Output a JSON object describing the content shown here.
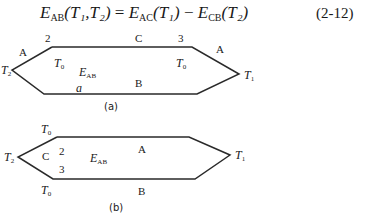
{
  "equation": {
    "lhs_symbol": "E",
    "lhs_sub": "AB",
    "lhs_args": "(T₁,T₂)",
    "eq": " = ",
    "t1_symbol": "E",
    "t1_sub": "AC",
    "t1_args": "(T₁)",
    "minus": " − ",
    "t2_symbol": "E",
    "t2_sub": "CB",
    "t2_args": "(T₂)",
    "number": "(2-12)"
  },
  "diagram_a": {
    "caption": "(a)",
    "labels": {
      "junction_2": "2",
      "conductor_c": "C",
      "junction_3": "3",
      "conductor_a_left": "A",
      "conductor_a_right": "A",
      "t2": "T",
      "t2_sub": "2",
      "t1": "T",
      "t1_sub": "1",
      "t0_left": "T",
      "t0_left_sub": "0",
      "t0_right": "T",
      "t0_right_sub": "0",
      "emf": "E",
      "emf_sub": "AB",
      "conductor_b": "B",
      "point_a": "a"
    }
  },
  "diagram_b": {
    "caption": "(b)",
    "labels": {
      "t0_top": "T",
      "t0_top_sub": "0",
      "t0_bottom": "T",
      "t0_bottom_sub": "0",
      "t2": "T",
      "t2_sub": "2",
      "t1": "T",
      "t1_sub": "1",
      "conductor_c": "C",
      "junction_2": "2",
      "junction_3": "3",
      "emf": "E",
      "emf_sub": "AB",
      "conductor_a": "A",
      "conductor_b": "B"
    }
  },
  "colors": {
    "line": "#2a2a2a",
    "text": "#1a1a1a",
    "background": "#ffffff"
  }
}
